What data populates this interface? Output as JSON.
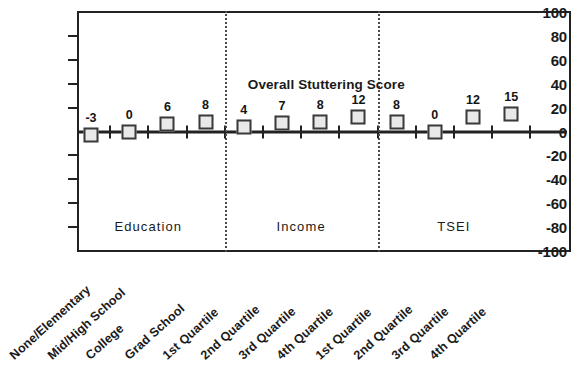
{
  "chart_data": {
    "type": "scatter",
    "title": "Overall Stuttering Score",
    "xlabel": "",
    "ylabel": "",
    "ylim": [
      -100,
      100
    ],
    "y_ticks": [
      100,
      80,
      60,
      40,
      20,
      0,
      -20,
      -40,
      -60,
      -80,
      -100
    ],
    "grid": false,
    "legend": "none",
    "marker": "square",
    "categories": [
      "None/Elementary",
      "Mid/High School",
      "College",
      "Grad School",
      "1st Quartile",
      "2nd Quartile",
      "3rd Quartile",
      "4th Quartile",
      "1st Quartile",
      "2nd Quartile",
      "3rd Quartile",
      "4th Quartile"
    ],
    "values": [
      -3,
      0,
      6,
      8,
      4,
      7,
      8,
      12,
      8,
      0,
      12,
      15
    ],
    "point_labels": [
      "-3",
      "0",
      "6",
      "8",
      "4",
      "7",
      "8",
      "12",
      "8",
      "0",
      "12",
      "15"
    ],
    "groups": [
      {
        "label": "Education",
        "start_index": 0,
        "end_index": 3
      },
      {
        "label": "Income",
        "start_index": 4,
        "end_index": 7
      },
      {
        "label": "TSEI",
        "start_index": 8,
        "end_index": 11
      }
    ],
    "group_label_y_value": -80,
    "colors": {
      "axis": "#222222",
      "marker_fill": "#e9e9e9",
      "marker_border": "#3a3a3a",
      "separator": "#4a4a4a",
      "text": "#1a1a1a",
      "background": "#ffffff"
    }
  }
}
